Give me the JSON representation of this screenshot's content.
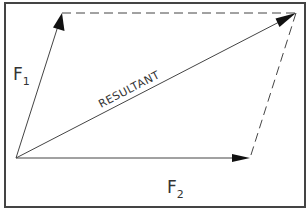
{
  "diagram": {
    "frame": {
      "x": 5,
      "y": 3,
      "width": 300,
      "height": 204,
      "stroke": "#444444"
    },
    "origin": {
      "x": 16,
      "y": 158
    },
    "vectors": [
      {
        "id": "F1",
        "label_main": "F",
        "label_sub": "1",
        "from": [
          16,
          158
        ],
        "to": [
          62,
          13
        ],
        "label_pos": [
          14,
          78
        ]
      },
      {
        "id": "F2",
        "label_main": "F",
        "label_sub": "2",
        "from": [
          16,
          158
        ],
        "to": [
          250,
          158
        ],
        "label_pos": [
          168,
          194
        ]
      },
      {
        "id": "resultant",
        "label": "RESULTANT",
        "from": [
          16,
          158
        ],
        "to": [
          296,
          13
        ],
        "label_pos": [
          100,
          107
        ],
        "label_angle": -27.4
      }
    ],
    "dashed_edges": [
      {
        "from": [
          62,
          13
        ],
        "to": [
          296,
          13
        ]
      },
      {
        "from": [
          296,
          13
        ],
        "to": [
          250,
          158
        ]
      }
    ],
    "colors": {
      "line": "#444444",
      "arrow": "#111111",
      "text": "#333333"
    }
  }
}
